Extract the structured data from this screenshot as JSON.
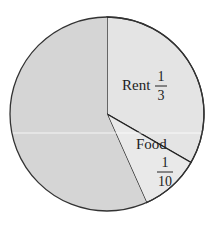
{
  "chart_data": {
    "type": "pie",
    "title": "",
    "slices": [
      {
        "label": "Rent",
        "fraction_text": "1/3",
        "numerator": "1",
        "denominator": "3",
        "value": 0.3333,
        "color": "#e4e4e4"
      },
      {
        "label": "Food",
        "fraction_text": "1/10",
        "numerator": "1",
        "denominator": "10",
        "value": 0.1,
        "color": "#e9e9e9"
      },
      {
        "label": "",
        "fraction_text": "",
        "value": 0.5667,
        "color": "#d5d5d5"
      }
    ],
    "start_angle_deg": 0,
    "direction": "clockwise_from_top"
  },
  "labels": {
    "rent": {
      "name": "Rent",
      "num": "1",
      "den": "3"
    },
    "food": {
      "name": "Food",
      "num": "1",
      "den": "10"
    }
  }
}
